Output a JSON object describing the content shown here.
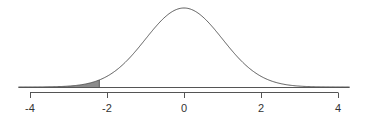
{
  "chart_data": {
    "type": "area",
    "title": "",
    "xlabel": "",
    "ylabel": "",
    "distribution": "standard normal",
    "mean": 0,
    "sd": 1,
    "xlim": [
      -4.3,
      4.3
    ],
    "shaded_region": {
      "from": -4.3,
      "to": -2.2,
      "color": "#8c8c8c"
    },
    "x_ticks": [
      -4,
      -2,
      0,
      2,
      4
    ],
    "x_tick_labels": [
      "-4",
      "-2",
      "0",
      "2",
      "4"
    ],
    "grid": false,
    "legend": null
  },
  "colors": {
    "curve": "#555555",
    "shade": "#8c8c8c",
    "axis": "#555555"
  }
}
